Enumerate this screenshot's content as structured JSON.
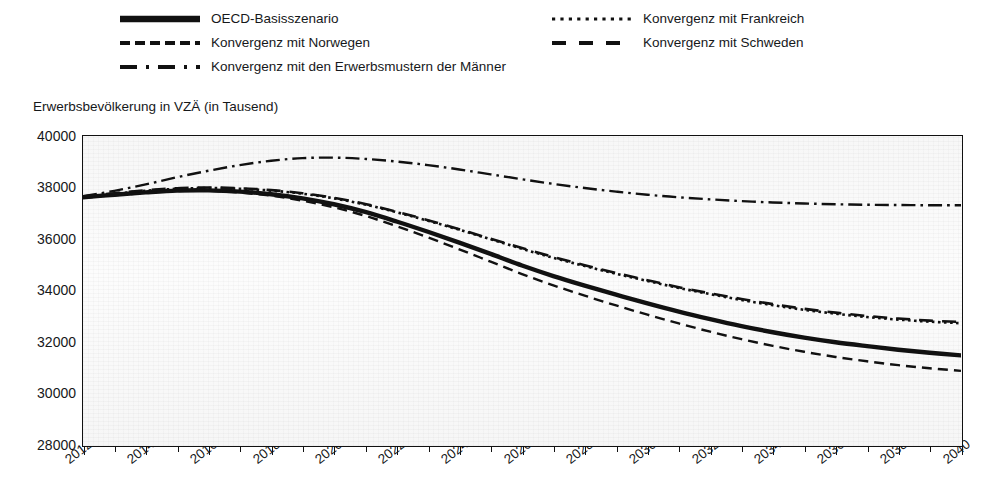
{
  "legend": {
    "entries": [
      {
        "label": "OECD-Basisszenario",
        "style": "solid-thick",
        "column": "a",
        "row": 1
      },
      {
        "label": "Konvergenz mit Norwegen",
        "style": "dashed",
        "column": "a",
        "row": 2
      },
      {
        "label": "Konvergenz mit den Erwerbsmustern der Männer",
        "style": "dash-dot",
        "column": "a",
        "row": 3
      },
      {
        "label": "Konvergenz mit Frankreich",
        "style": "dotted",
        "column": "b",
        "row": 1
      },
      {
        "label": "Konvergenz mit Schweden",
        "style": "long-dash",
        "column": "b",
        "row": 2
      }
    ]
  },
  "chart_data": {
    "type": "line",
    "title": "",
    "subtitle": "",
    "xlabel": "",
    "ylabel": "Erwerbsbevölkerung in VZÄ (in Tausend)",
    "xlim": [
      2012,
      2040
    ],
    "ylim": [
      28000,
      40000
    ],
    "ytick_labels": [
      "40000",
      "38000",
      "36000",
      "34000",
      "32000",
      "30000",
      "28000"
    ],
    "yticks": [
      40000,
      38000,
      36000,
      34000,
      32000,
      30000,
      28000
    ],
    "xtick_labels": [
      "2012",
      "2014",
      "2016",
      "2018",
      "2020",
      "2022",
      "2024",
      "2026",
      "2028",
      "2030",
      "2032",
      "2034",
      "2036",
      "2038",
      "2040"
    ],
    "xticks": [
      2012,
      2014,
      2016,
      2018,
      2020,
      2022,
      2024,
      2026,
      2028,
      2030,
      2032,
      2034,
      2036,
      2038,
      2040
    ],
    "x_minor_ticks": [
      2013,
      2015,
      2017,
      2019,
      2021,
      2023,
      2025,
      2027,
      2029,
      2031,
      2033,
      2035,
      2037,
      2039
    ],
    "grid": false,
    "legend_position": "above-plot",
    "x": [
      2012,
      2013,
      2014,
      2015,
      2016,
      2017,
      2018,
      2019,
      2020,
      2021,
      2022,
      2023,
      2024,
      2025,
      2026,
      2027,
      2028,
      2029,
      2030,
      2031,
      2032,
      2033,
      2034,
      2035,
      2036,
      2037,
      2038,
      2039,
      2040
    ],
    "series": [
      {
        "name": "OECD-Basisszenario",
        "style": "solid-thick",
        "color": "#111111",
        "values": [
          37620,
          37720,
          37810,
          37880,
          37890,
          37840,
          37740,
          37580,
          37350,
          37050,
          36680,
          36280,
          35860,
          35420,
          34970,
          34560,
          34190,
          33840,
          33500,
          33180,
          32890,
          32620,
          32380,
          32170,
          31990,
          31840,
          31700,
          31580,
          31480
        ]
      },
      {
        "name": "Konvergenz mit Norwegen",
        "style": "dashed",
        "color": "#111111",
        "values": [
          37600,
          37700,
          37790,
          37860,
          37870,
          37800,
          37680,
          37490,
          37230,
          36900,
          36500,
          36060,
          35600,
          35120,
          34640,
          34200,
          33800,
          33420,
          33060,
          32720,
          32400,
          32110,
          31850,
          31620,
          31420,
          31250,
          31100,
          30980,
          30880
        ]
      },
      {
        "name": "Konvergenz mit den Erwerbsmustern der Männer",
        "style": "dash-dot",
        "color": "#111111",
        "values": [
          37660,
          37870,
          38120,
          38400,
          38650,
          38870,
          39040,
          39140,
          39160,
          39110,
          39010,
          38870,
          38700,
          38510,
          38320,
          38140,
          37980,
          37840,
          37720,
          37620,
          37540,
          37470,
          37420,
          37380,
          37350,
          37330,
          37320,
          37310,
          37310
        ]
      },
      {
        "name": "Konvergenz mit Frankreich",
        "style": "dotted",
        "color": "#111111",
        "values": [
          37640,
          37760,
          37870,
          37950,
          37980,
          37950,
          37880,
          37760,
          37580,
          37340,
          37040,
          36710,
          36360,
          35990,
          35620,
          35270,
          34950,
          34650,
          34370,
          34100,
          33860,
          33630,
          33430,
          33250,
          33100,
          32970,
          32870,
          32790,
          32730
        ]
      },
      {
        "name": "Konvergenz mit Schweden",
        "style": "long-dash",
        "color": "#111111",
        "values": [
          37650,
          37780,
          37890,
          37970,
          38000,
          37970,
          37900,
          37780,
          37600,
          37360,
          37060,
          36730,
          36380,
          36010,
          35650,
          35300,
          34980,
          34680,
          34400,
          34130,
          33890,
          33670,
          33470,
          33290,
          33140,
          33010,
          32910,
          32830,
          32780
        ]
      }
    ]
  }
}
